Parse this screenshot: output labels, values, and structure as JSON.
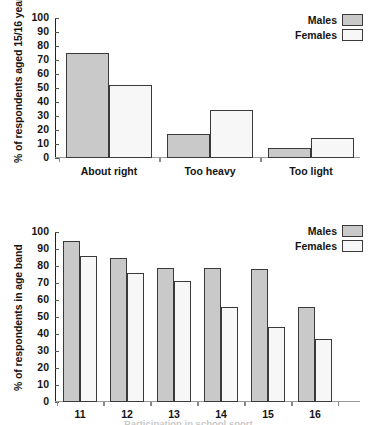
{
  "page": {
    "bottom_caption": "Participation in school sport",
    "colors": {
      "males": "#c9c9c9",
      "females": "#f7f7f7",
      "bar_border": "#3a3a3a",
      "axis": "#222222",
      "text": "#141414"
    }
  },
  "chart_data": [
    {
      "id": "chart-1",
      "type": "bar",
      "title": "",
      "xlabel": "",
      "ylabel": "% of respondents aged 15/16 years",
      "categories": [
        "About right",
        "Too heavy",
        "Too light"
      ],
      "series": [
        {
          "name": "Males",
          "values": [
            75,
            17,
            7
          ]
        },
        {
          "name": "Females",
          "values": [
            52,
            34,
            14
          ]
        }
      ],
      "ylim": [
        0,
        100
      ],
      "yticks": [
        0,
        10,
        20,
        30,
        40,
        50,
        60,
        70,
        80,
        90,
        100
      ],
      "grid": false,
      "legend": {
        "position": "top-right",
        "entries": [
          "Males",
          "Females"
        ]
      }
    },
    {
      "id": "chart-2",
      "type": "bar",
      "title": "",
      "xlabel": "",
      "ylabel": "% of respondents in age band",
      "categories": [
        "11",
        "12",
        "13",
        "14",
        "15",
        "16"
      ],
      "series": [
        {
          "name": "Males",
          "values": [
            95,
            85,
            79,
            79,
            78,
            56
          ]
        },
        {
          "name": "Females",
          "values": [
            86,
            76,
            71,
            56,
            44,
            37
          ]
        }
      ],
      "ylim": [
        0,
        100
      ],
      "yticks": [
        0,
        10,
        20,
        30,
        40,
        50,
        60,
        70,
        80,
        90,
        100
      ],
      "grid": false,
      "legend": {
        "position": "top-right",
        "entries": [
          "Males",
          "Females"
        ]
      }
    }
  ]
}
